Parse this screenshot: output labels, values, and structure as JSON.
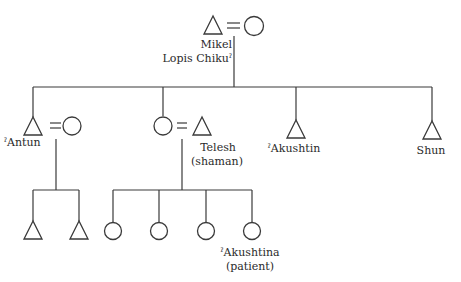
{
  "diagram": {
    "type": "kinship-chart",
    "colors": {
      "line": "#3a3a3a",
      "text": "#2a2a2a",
      "background": "#ffffff"
    },
    "generation_1": {
      "couple": {
        "husband": {
          "symbol": "triangle",
          "label_line1": "Mikel",
          "label_line2": "Lopis Chikuˀ"
        },
        "wife": {
          "symbol": "circle"
        }
      }
    },
    "generation_2": [
      {
        "id": "antun",
        "symbol": "triangle",
        "label": "ˀAntun",
        "spouse": {
          "symbol": "circle"
        }
      },
      {
        "id": "daughter",
        "symbol": "circle",
        "spouse": {
          "symbol": "triangle",
          "label_line1": "Telesh",
          "label_line2": "(shaman)"
        }
      },
      {
        "id": "akushtin",
        "symbol": "triangle",
        "label": "ˀAkushtin"
      },
      {
        "id": "shun",
        "symbol": "triangle",
        "label": "Shun"
      }
    ],
    "generation_3": {
      "antun_children": [
        {
          "symbol": "triangle"
        },
        {
          "symbol": "triangle"
        }
      ],
      "telesh_children": [
        {
          "symbol": "circle"
        },
        {
          "symbol": "circle"
        },
        {
          "symbol": "circle"
        },
        {
          "symbol": "circle",
          "label_line1": "ˀAkushtina",
          "label_line2": "(patient)"
        }
      ]
    },
    "marriage_symbol": "="
  }
}
